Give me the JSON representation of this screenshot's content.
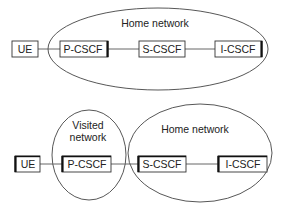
{
  "diagram": {
    "top": {
      "description": "Home network containing P-CSCF, S-CSCF, I-CSCF",
      "region": {
        "label": "Home network"
      },
      "nodes": [
        {
          "id": "ue",
          "label": "UE"
        },
        {
          "id": "pcscf",
          "label": "P-CSCF"
        },
        {
          "id": "scscf",
          "label": "S-CSCF"
        },
        {
          "id": "icscf",
          "label": "I-CSCF"
        }
      ],
      "edges": [
        [
          "ue",
          "pcscf"
        ],
        [
          "pcscf",
          "scscf"
        ],
        [
          "scscf",
          "icscf"
        ]
      ]
    },
    "bottom": {
      "description": "P-CSCF in visited network; S-CSCF and I-CSCF in home network",
      "regions": [
        {
          "id": "visited",
          "label_line1": "Visited",
          "label_line2": "network"
        },
        {
          "id": "home",
          "label": "Home network"
        }
      ],
      "nodes": [
        {
          "id": "ue",
          "label": "UE"
        },
        {
          "id": "pcscf",
          "label": "P-CSCF"
        },
        {
          "id": "scscf",
          "label": "S-CSCF"
        },
        {
          "id": "icscf",
          "label": "I-CSCF"
        }
      ],
      "edges": [
        [
          "ue",
          "pcscf"
        ],
        [
          "pcscf",
          "scscf"
        ],
        [
          "scscf",
          "icscf"
        ]
      ]
    },
    "colors": {
      "stroke": "#333333",
      "text": "#222222",
      "background": "#ffffff"
    }
  }
}
